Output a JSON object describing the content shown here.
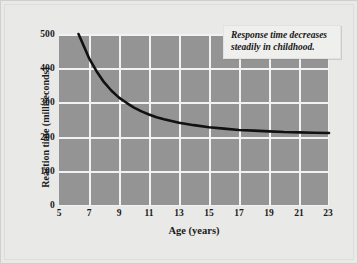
{
  "chart_data": {
    "type": "line",
    "title": "",
    "xlabel": "Age (years)",
    "ylabel": "Reaction time (milliseconds)",
    "xlim": [
      5,
      23
    ],
    "ylim": [
      0,
      500
    ],
    "xticks": [
      5,
      7,
      9,
      11,
      13,
      15,
      17,
      19,
      21,
      23
    ],
    "yticks": [
      0,
      100,
      200,
      300,
      400,
      500
    ],
    "grid": true,
    "legend": "none",
    "plot_background": "#949494",
    "gridline_color": "#f2f2f2",
    "line_color": "#111111",
    "annotations": [
      {
        "text": "Response time decreases steadily in childhood.",
        "position": "top-right"
      }
    ],
    "series": [
      {
        "name": "Reaction time",
        "x": [
          6.3,
          6.6,
          7,
          7.5,
          8,
          8.5,
          9,
          9.5,
          10,
          10.5,
          11,
          11.5,
          12,
          13,
          14,
          15,
          16,
          17,
          18,
          19,
          20,
          21,
          22,
          23
        ],
        "values": [
          500,
          470,
          430,
          392,
          360,
          335,
          315,
          300,
          286,
          275,
          266,
          258,
          252,
          242,
          235,
          229,
          225,
          221,
          219,
          217,
          215,
          214,
          213,
          212
        ]
      }
    ]
  },
  "annotation": {
    "line1": "Response time decreases",
    "line2": "steadily in childhood.",
    "full": "Response time decreases steadily in childhood."
  },
  "axes": {
    "y_title": "Reaction time (milliseconds)",
    "x_title": "Age (years)",
    "y_labels": [
      "500",
      "400",
      "300",
      "200",
      "100",
      "0"
    ],
    "x_labels": [
      "5",
      "7",
      "9",
      "11",
      "13",
      "15",
      "17",
      "19",
      "21",
      "23"
    ]
  }
}
